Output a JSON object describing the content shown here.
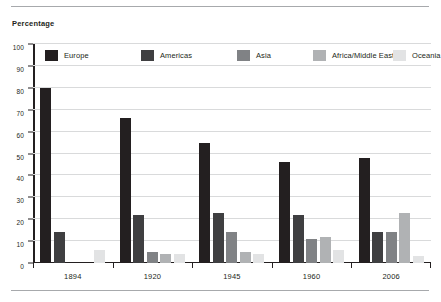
{
  "axis_title": "Percentage",
  "chart_data": {
    "type": "bar",
    "title": "",
    "subtitle": "",
    "xlabel": "",
    "ylabel": "Percentage",
    "ylim": [
      0,
      100
    ],
    "yticks": [
      0,
      10,
      20,
      30,
      40,
      50,
      60,
      70,
      80,
      90,
      100
    ],
    "ytick_labels": [
      "0",
      "10",
      "20",
      "30",
      "40",
      "50",
      "60",
      "70",
      "80",
      "90",
      "100"
    ],
    "grid": true,
    "legend_position": "top-inside",
    "categories": [
      "1894",
      "1920",
      "1945",
      "1960",
      "2006"
    ],
    "series": [
      {
        "name": "Europe",
        "color": "#231f20",
        "values": [
          80,
          66,
          55,
          46,
          48
        ]
      },
      {
        "name": "Americas",
        "color": "#3f3f41",
        "values": [
          14,
          22,
          23,
          22,
          14
        ]
      },
      {
        "name": "Asia",
        "color": "#808285",
        "values": [
          0,
          5,
          14,
          11,
          14
        ]
      },
      {
        "name": "Africa/Middle East",
        "color": "#b0b2b4",
        "values": [
          0,
          4,
          5,
          12,
          23
        ]
      },
      {
        "name": "Oceania",
        "color": "#e2e3e4",
        "values": [
          6,
          4,
          4,
          6,
          3
        ]
      }
    ]
  }
}
